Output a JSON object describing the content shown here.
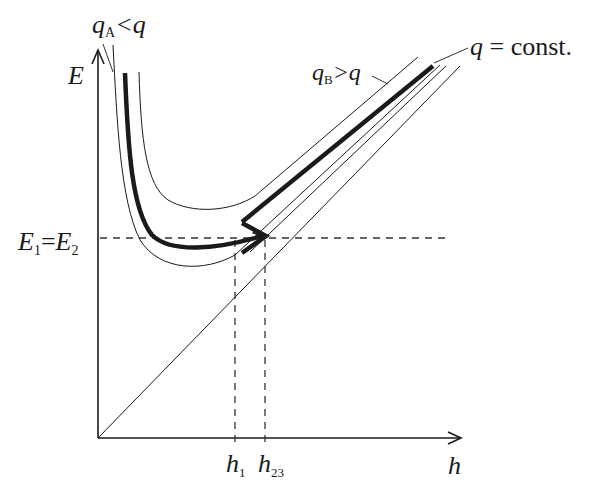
{
  "diagram": {
    "axes": {
      "y_label": "E",
      "x_label": "h"
    },
    "labels": {
      "qA_main": "q",
      "qA_sub": "A",
      "qA_rel": "<q",
      "qB_main": "q",
      "qB_sub": "B",
      "qB_rel": ">q",
      "q_main": "q",
      "q_rel": " = const.",
      "E1": "E",
      "E1_sub": "1",
      "eq": "=",
      "E2": "E",
      "E2_sub": "2",
      "h1": "h",
      "h1_sub": "1",
      "h23": "h",
      "h23_sub": "23"
    },
    "colors": {
      "line": "#1a1a1a",
      "dashed": "#333333",
      "background": "#ffffff"
    },
    "curves": [
      {
        "name": "qA<q",
        "style": "thin"
      },
      {
        "name": "q = const.",
        "style": "thick",
        "arrow": true
      },
      {
        "name": "qB>q",
        "style": "thin"
      },
      {
        "name": "E = h",
        "style": "thin diagonal"
      }
    ],
    "reference_lines": [
      {
        "name": "E1=E2",
        "orientation": "horizontal",
        "style": "dashed"
      },
      {
        "name": "h1",
        "orientation": "vertical",
        "style": "dashed"
      },
      {
        "name": "h23",
        "orientation": "vertical",
        "style": "dashed"
      }
    ]
  }
}
